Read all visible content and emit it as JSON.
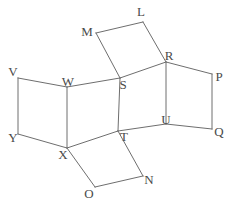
{
  "figure": {
    "kind": "wireframe-diagram",
    "width": 235,
    "height": 204,
    "background_color": "#ffffff",
    "edge_color": "#6e6e6e",
    "edge_width": 1,
    "label_color": "#4a4a4a",
    "label_font_size": 13
  },
  "vertices": [
    {
      "id": "L",
      "label": "L",
      "x": 143,
      "y": 22,
      "label_x": 141,
      "label_y": 11
    },
    {
      "id": "M",
      "label": "M",
      "x": 96,
      "y": 33,
      "label_x": 87,
      "label_y": 31
    },
    {
      "id": "R",
      "label": "R",
      "x": 166,
      "y": 62,
      "label_x": 169,
      "label_y": 55
    },
    {
      "id": "P",
      "label": "P",
      "x": 212,
      "y": 74,
      "label_x": 219,
      "label_y": 76
    },
    {
      "id": "V",
      "label": "V",
      "x": 18,
      "y": 78,
      "label_x": 13,
      "label_y": 71
    },
    {
      "id": "W",
      "label": "W",
      "x": 67,
      "y": 87,
      "label_x": 68,
      "label_y": 81
    },
    {
      "id": "S",
      "label": "S",
      "x": 120,
      "y": 78,
      "label_x": 123,
      "label_y": 84
    },
    {
      "id": "Q",
      "label": "Q",
      "x": 212,
      "y": 129,
      "label_x": 219,
      "label_y": 131
    },
    {
      "id": "U",
      "label": "U",
      "x": 166,
      "y": 124,
      "label_x": 166,
      "label_y": 119
    },
    {
      "id": "Y",
      "label": "Y",
      "x": 18,
      "y": 134,
      "label_x": 13,
      "label_y": 137
    },
    {
      "id": "T",
      "label": "T",
      "x": 118,
      "y": 131,
      "label_x": 124,
      "label_y": 136
    },
    {
      "id": "X",
      "label": "X",
      "x": 67,
      "y": 148,
      "label_x": 63,
      "label_y": 154
    },
    {
      "id": "N",
      "label": "N",
      "x": 143,
      "y": 176,
      "label_x": 149,
      "label_y": 179
    },
    {
      "id": "O",
      "label": "O",
      "x": 95,
      "y": 187,
      "label_x": 89,
      "label_y": 193
    }
  ],
  "edges": [
    {
      "from": "M",
      "to": "L"
    },
    {
      "from": "L",
      "to": "R"
    },
    {
      "from": "M",
      "to": "S"
    },
    {
      "from": "S",
      "to": "R"
    },
    {
      "from": "R",
      "to": "P"
    },
    {
      "from": "P",
      "to": "Q"
    },
    {
      "from": "Q",
      "to": "U"
    },
    {
      "from": "U",
      "to": "R"
    },
    {
      "from": "V",
      "to": "W"
    },
    {
      "from": "V",
      "to": "Y"
    },
    {
      "from": "Y",
      "to": "X"
    },
    {
      "from": "W",
      "to": "X"
    },
    {
      "from": "W",
      "to": "S"
    },
    {
      "from": "X",
      "to": "T"
    },
    {
      "from": "S",
      "to": "T"
    },
    {
      "from": "T",
      "to": "U"
    },
    {
      "from": "X",
      "to": "O"
    },
    {
      "from": "O",
      "to": "N"
    },
    {
      "from": "N",
      "to": "T"
    }
  ]
}
